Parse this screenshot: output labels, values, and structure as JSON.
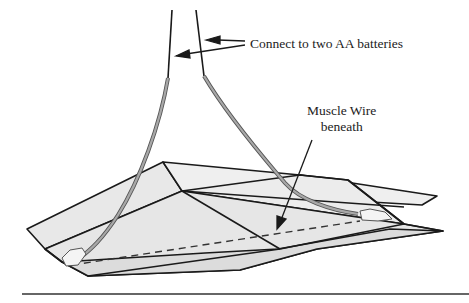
{
  "diagram": {
    "labels": {
      "connect": "Connect to two AA batteries",
      "muscle_line1": "Muscle Wire",
      "muscle_line2": "beneath"
    },
    "colors": {
      "line": "#1a1a1a",
      "fill": "#ececec",
      "wire": "#9a9a9a",
      "background": "#ffffff"
    }
  }
}
